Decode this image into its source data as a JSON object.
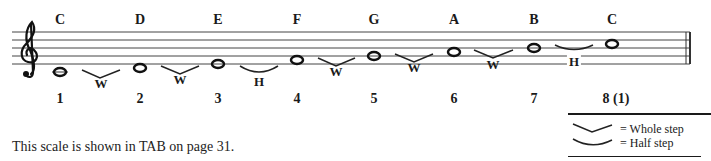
{
  "scale": {
    "notes": [
      {
        "letter": "C",
        "degree": "1",
        "x": 60,
        "y": 72
      },
      {
        "letter": "D",
        "degree": "2",
        "x": 140,
        "y": 68
      },
      {
        "letter": "E",
        "degree": "3",
        "x": 218,
        "y": 64
      },
      {
        "letter": "F",
        "degree": "4",
        "x": 297,
        "y": 60
      },
      {
        "letter": "G",
        "degree": "5",
        "x": 374,
        "y": 56
      },
      {
        "letter": "A",
        "degree": "6",
        "x": 454,
        "y": 52
      },
      {
        "letter": "B",
        "degree": "7",
        "x": 534,
        "y": 48
      },
      {
        "letter": "C",
        "degree": "8 (1)",
        "x": 612,
        "y": 44
      }
    ],
    "steps": [
      {
        "type": "whole",
        "label": "W"
      },
      {
        "type": "whole",
        "label": "W"
      },
      {
        "type": "half",
        "label": "H"
      },
      {
        "type": "whole",
        "label": "W"
      },
      {
        "type": "whole",
        "label": "W"
      },
      {
        "type": "whole",
        "label": "W"
      },
      {
        "type": "half",
        "label": "H"
      }
    ]
  },
  "caption": "This scale is shown in TAB on page 31.",
  "legend": {
    "whole": "= Whole step",
    "half": "= Half step"
  },
  "icons": {
    "clef": "treble-clef",
    "whole_step": "v-bracket",
    "half_step": "arc-bracket"
  }
}
